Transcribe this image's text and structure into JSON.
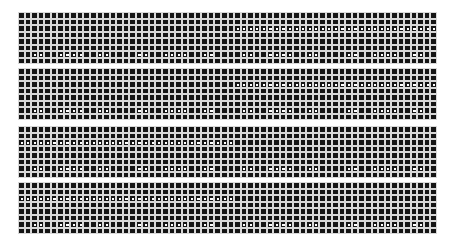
{
  "grid": {
    "columns": 64,
    "colors": {
      "cell": "#151515",
      "gridline": "#d8d8d8",
      "dot": "#ffffff",
      "background": "#ffffff"
    },
    "scattered_dot_columns": [
      2,
      3,
      6,
      7,
      8,
      9,
      12,
      13,
      18,
      19,
      22,
      23,
      24,
      25,
      28,
      29,
      34,
      35,
      38,
      39,
      40,
      41,
      44,
      45,
      50,
      51,
      54,
      55,
      56,
      57,
      60,
      61
    ],
    "blocks": [
      {
        "top": 12,
        "rows": 8,
        "range_row": 2,
        "range_start": 33,
        "range_end": 63,
        "scatter_row": 6
      },
      {
        "top": 68,
        "rows": 8,
        "range_row": 2,
        "range_start": 33,
        "range_end": 63,
        "scatter_row": 6
      },
      {
        "top": 126,
        "rows": 8,
        "range_row": 2,
        "range_start": 0,
        "range_end": 32,
        "scatter_row": 6
      },
      {
        "top": 182,
        "rows": 8,
        "range_row": 2,
        "range_start": 0,
        "range_end": 32,
        "scatter_row": 6
      }
    ]
  }
}
